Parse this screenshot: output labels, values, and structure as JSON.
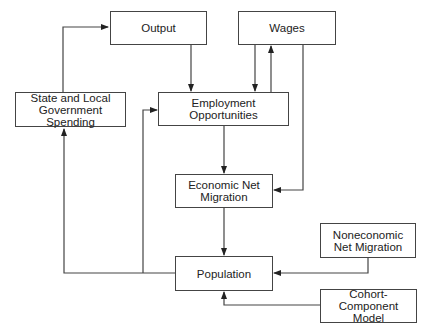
{
  "diagram": {
    "nodes": {
      "output": "Output",
      "wages": "Wages",
      "state_local": "State and Local Government Spending",
      "employment": "Employment Opportunities",
      "econ_migration": "Economic Net Migration",
      "population": "Population",
      "nonecon_migration": "Noneconomic Net Migration",
      "cohort": "Cohort-Component Model"
    },
    "edges": [
      {
        "from": "state_local",
        "to": "output"
      },
      {
        "from": "output",
        "to": "employment"
      },
      {
        "from": "wages",
        "to": "employment"
      },
      {
        "from": "employment",
        "to": "wages"
      },
      {
        "from": "employment",
        "to": "econ_migration"
      },
      {
        "from": "wages",
        "to": "econ_migration"
      },
      {
        "from": "econ_migration",
        "to": "population"
      },
      {
        "from": "population",
        "to": "state_local"
      },
      {
        "from": "population",
        "to": "employment"
      },
      {
        "from": "nonecon_migration",
        "to": "population"
      },
      {
        "from": "cohort",
        "to": "population"
      }
    ]
  }
}
